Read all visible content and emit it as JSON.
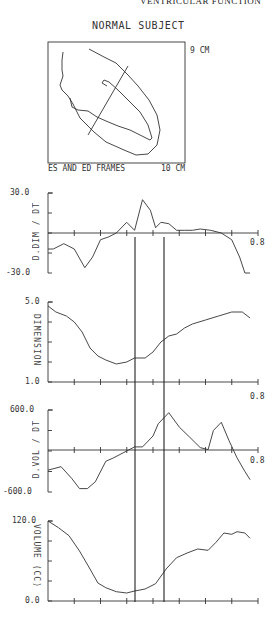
{
  "page": {
    "running_header": "VENTRICULAR FUNCTION",
    "title": "NORMAL SUBJECT"
  },
  "frame_panel": {
    "height_label": "9 CM",
    "width_label": "10 CM",
    "caption": "ES AND ED FRAMES"
  },
  "chart_data": [
    {
      "type": "line",
      "title": "D.DIM / DT",
      "ylabel": "D.DIM / DT",
      "xlabel": "",
      "ylim": [
        -30.0,
        30.0
      ],
      "xlim": [
        0.0,
        0.8
      ],
      "y_tick_labels": [
        "30.0",
        "-30.0"
      ],
      "x_end_label": "0.8",
      "grid": false,
      "x": [
        0.0,
        0.02,
        0.06,
        0.1,
        0.14,
        0.17,
        0.2,
        0.23,
        0.26,
        0.3,
        0.33,
        0.36,
        0.39,
        0.41,
        0.43,
        0.46,
        0.49,
        0.52,
        0.55,
        0.58,
        0.62,
        0.66,
        0.7,
        0.73,
        0.75,
        0.77
      ],
      "values": [
        -12,
        -12,
        -8,
        -12,
        -26,
        -18,
        -5,
        -3,
        0,
        8,
        2,
        25,
        17,
        4,
        8,
        7,
        2,
        2,
        2,
        3,
        2,
        0,
        -5,
        -18,
        -30,
        -30
      ]
    },
    {
      "type": "line",
      "title": "DIMENSION",
      "ylabel": "DIMENSION",
      "xlabel": "",
      "ylim": [
        1.0,
        5.0
      ],
      "xlim": [
        0.0,
        0.8
      ],
      "y_tick_labels": [
        "5.0",
        "1.0"
      ],
      "x_end_label": "0.8",
      "grid": false,
      "x": [
        0.0,
        0.03,
        0.07,
        0.1,
        0.13,
        0.16,
        0.19,
        0.22,
        0.26,
        0.3,
        0.33,
        0.37,
        0.4,
        0.43,
        0.46,
        0.49,
        0.52,
        0.55,
        0.6,
        0.65,
        0.7,
        0.74,
        0.77
      ],
      "values": [
        4.8,
        4.5,
        4.3,
        4.0,
        3.5,
        2.7,
        2.3,
        2.1,
        1.9,
        2.0,
        2.2,
        2.2,
        2.5,
        3.0,
        3.3,
        3.4,
        3.7,
        3.9,
        4.1,
        4.3,
        4.5,
        4.5,
        4.2
      ]
    },
    {
      "type": "line",
      "title": "D.VOL / DT",
      "ylabel": "D.VOL / DT",
      "xlabel": "",
      "ylim": [
        -600.0,
        600.0
      ],
      "xlim": [
        0.0,
        0.8
      ],
      "y_tick_labels": [
        "600.0",
        "-600.0"
      ],
      "x_end_label": "0.8",
      "grid": false,
      "x": [
        0.0,
        0.05,
        0.09,
        0.12,
        0.15,
        0.18,
        0.22,
        0.25,
        0.3,
        0.33,
        0.36,
        0.4,
        0.42,
        0.46,
        0.5,
        0.54,
        0.58,
        0.61,
        0.63,
        0.66,
        0.69,
        0.72,
        0.75,
        0.77
      ],
      "values": [
        -280,
        -230,
        -400,
        -550,
        -550,
        -450,
        -150,
        -100,
        0,
        60,
        60,
        220,
        400,
        560,
        350,
        200,
        50,
        20,
        300,
        420,
        150,
        -100,
        -300,
        -420
      ]
    },
    {
      "type": "line",
      "title": "VOLUME (CC)",
      "ylabel": "VOLUME (CC)",
      "xlabel": "",
      "ylim": [
        0.0,
        120.0
      ],
      "xlim": [
        0.0,
        0.8
      ],
      "y_tick_labels": [
        "120.0",
        "0.0"
      ],
      "x_end_label": "",
      "grid": false,
      "x": [
        0.0,
        0.04,
        0.08,
        0.12,
        0.16,
        0.19,
        0.22,
        0.26,
        0.3,
        0.33,
        0.37,
        0.41,
        0.45,
        0.49,
        0.53,
        0.57,
        0.61,
        0.64,
        0.67,
        0.7,
        0.72,
        0.75,
        0.77
      ],
      "values": [
        120,
        110,
        98,
        75,
        48,
        27,
        20,
        14,
        12,
        15,
        18,
        26,
        48,
        65,
        72,
        78,
        76,
        88,
        102,
        100,
        104,
        102,
        94
      ]
    }
  ],
  "markers": {
    "es_time": 0.33,
    "ed_time": 0.44
  }
}
